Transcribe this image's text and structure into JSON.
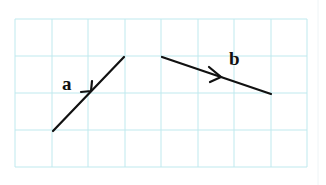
{
  "diagram": {
    "title": "",
    "grid": {
      "columns": 8,
      "rows": 4,
      "line_color": "#bfe9ee",
      "origin_px": [
        15,
        19
      ],
      "cell_px": [
        36.5,
        37
      ]
    },
    "vectors": [
      {
        "id": "a",
        "label": "a",
        "start_grid": [
          1,
          3
        ],
        "end_grid": [
          3,
          1
        ],
        "start_px": [
          53,
          131
        ],
        "end_px": [
          124,
          57
        ],
        "arrow_at": "midpoint",
        "color": "#111111"
      },
      {
        "id": "b",
        "label": "b",
        "start_grid": [
          4,
          1
        ],
        "end_grid": [
          7,
          2
        ],
        "start_px": [
          162,
          57
        ],
        "end_px": [
          271,
          94
        ],
        "arrow_at": "midpoint",
        "color": "#111111"
      }
    ],
    "labels": {
      "a": "a",
      "b": "b"
    }
  }
}
